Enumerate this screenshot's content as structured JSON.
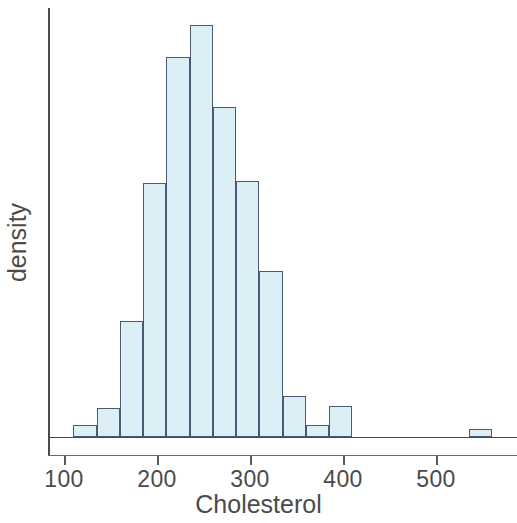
{
  "chart_data": {
    "type": "bar",
    "title": "",
    "subtitle": "",
    "xlabel": "Cholesterol",
    "ylabel": "density",
    "grid": false,
    "legend": null,
    "orientation": "vertical",
    "histogram": true,
    "bin_width": 25,
    "xlim": [
      100,
      575
    ],
    "ylim": [
      0,
      1
    ],
    "xticks": [
      100,
      200,
      300,
      400,
      500
    ],
    "xtick_labels": [
      "100",
      "200",
      "300",
      "400",
      "500"
    ],
    "yticks": [],
    "ytick_labels": [],
    "bin_edges": [
      110,
      135,
      160,
      185,
      210,
      235,
      260,
      285,
      310,
      335,
      360,
      385,
      410,
      435,
      460,
      485,
      510,
      535,
      560
    ],
    "categories": [
      "110-135",
      "135-160",
      "160-185",
      "185-210",
      "210-235",
      "235-260",
      "260-285",
      "285-310",
      "310-335",
      "335-360",
      "360-385",
      "385-410",
      "410-435",
      "435-460",
      "460-485",
      "485-510",
      "510-535",
      "535-560"
    ],
    "values": [
      0.028,
      0.068,
      0.27,
      0.592,
      0.886,
      0.96,
      0.769,
      0.597,
      0.387,
      0.096,
      0.028,
      0.072,
      0.0,
      0.0,
      0.0,
      0.0,
      0.0,
      0.019
    ],
    "bar_fill_color": "#dceef6",
    "bar_edge_color": "#4a5a72",
    "axis_color": "#4a4a4a",
    "text_color": "#4b4b4b",
    "background_color": "#ffffff"
  },
  "axis": {
    "x_label": "Cholesterol",
    "y_label": "density"
  }
}
